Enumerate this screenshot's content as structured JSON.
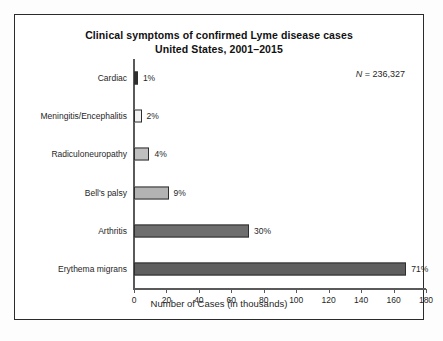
{
  "chart_data": {
    "type": "bar",
    "orientation": "horizontal",
    "title": "Clinical symptoms of confirmed Lyme disease cases",
    "subtitle": "United States, 2001–2015",
    "xlabel": "Number of Cases (in thousands)",
    "ylabel": "",
    "xlim": [
      0,
      180
    ],
    "xticks": [
      0,
      20,
      40,
      60,
      80,
      100,
      120,
      140,
      160,
      180
    ],
    "grid": false,
    "legend": null,
    "annotations": [
      {
        "name": "sample-size",
        "symbol": "N",
        "text": "N = 236,327",
        "equals_value": "236,327"
      }
    ],
    "categories": [
      "Cardiac",
      "Meningitis/Encephalitis",
      "Radiculoneuropathy",
      "Bell's palsy",
      "Arthritis",
      "Erythema migrans"
    ],
    "values": [
      2.4,
      4.7,
      9.5,
      21.3,
      70.9,
      167.8
    ],
    "value_unit": "thousands of cases",
    "data_labels": [
      "1%",
      "2%",
      "4%",
      "9%",
      "30%",
      "71%"
    ],
    "percent_values": [
      1,
      2,
      4,
      9,
      30,
      71
    ],
    "bar_colors": [
      "#2f2f2f",
      "#f2f2f2",
      "#bfbfbf",
      "#b3b3b3",
      "#6e6e6e",
      "#5f5f5f"
    ],
    "bar_border_color": "#2e2e2e"
  },
  "axis": {
    "tick_labels": [
      "0",
      "20",
      "40",
      "60",
      "80",
      "100",
      "120",
      "140",
      "160",
      "180"
    ]
  }
}
